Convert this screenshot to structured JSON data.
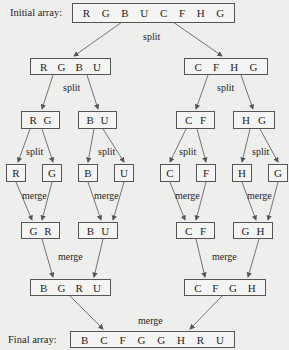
{
  "labels": {
    "initial": "Initial array:",
    "final": "Final array:"
  },
  "ops": {
    "split": "split",
    "merge": "merge"
  },
  "arrays": {
    "initial": [
      "R",
      "G",
      "B",
      "U",
      "C",
      "F",
      "H",
      "G"
    ],
    "split1_left": [
      "R",
      "G",
      "B",
      "U"
    ],
    "split1_right": [
      "C",
      "F",
      "H",
      "G"
    ],
    "split2_a": [
      "R",
      "G"
    ],
    "split2_b": [
      "B",
      "U"
    ],
    "split2_c": [
      "C",
      "F"
    ],
    "split2_d": [
      "H",
      "G"
    ],
    "single": [
      "R",
      "G",
      "B",
      "U",
      "C",
      "F",
      "H",
      "G"
    ],
    "merge1_a": [
      "G",
      "R"
    ],
    "merge1_b": [
      "B",
      "U"
    ],
    "merge1_c": [
      "C",
      "F"
    ],
    "merge1_d": [
      "G",
      "H"
    ],
    "merge2_left": [
      "B",
      "G",
      "R",
      "U"
    ],
    "merge2_right": [
      "C",
      "F",
      "G",
      "H"
    ],
    "final": [
      "B",
      "C",
      "F",
      "G",
      "G",
      "H",
      "R",
      "U"
    ]
  }
}
